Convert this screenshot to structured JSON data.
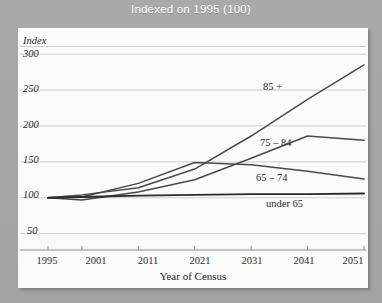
{
  "figure": {
    "title": "Indexed on 1995 (100)",
    "title_color": "#ffffff",
    "background_color": "#a8a8a8",
    "panel_color": "#fbfbfb"
  },
  "axes": {
    "y_title": "Index",
    "x_title": "Year of Census",
    "y_ticks": [
      "300",
      "250",
      "200",
      "150",
      "100",
      "50"
    ],
    "x_ticks": [
      "1995",
      "2001",
      "2011",
      "2021",
      "2031",
      "2041",
      "2051"
    ]
  },
  "series_labels": {
    "s85plus": "85 +",
    "s75_84": "75 – 84",
    "s65_74": "65 – 74",
    "under65": "under 65"
  },
  "chart_data": {
    "type": "line",
    "title": "Indexed on 1995 (100)",
    "xlabel": "Year of Census",
    "ylabel": "Index",
    "x": [
      1995,
      2001,
      2011,
      2021,
      2031,
      2041,
      2051
    ],
    "xlim": [
      1995,
      2051
    ],
    "ylim": [
      30,
      310
    ],
    "grid": true,
    "gridlines": [
      50,
      100,
      150,
      200,
      250,
      300
    ],
    "legend_position": "inline-labels",
    "series": [
      {
        "name": "85 +",
        "color": "#4a4a4a",
        "values": [
          100,
          104,
          114,
          140,
          186,
          237,
          285
        ],
        "label_text": "85 +"
      },
      {
        "name": "75 – 84",
        "color": "#4a4a4a",
        "values": [
          100,
          97,
          108,
          125,
          155,
          186,
          180
        ],
        "label_text": "75 – 84"
      },
      {
        "name": "65 – 74",
        "color": "#4a4a4a",
        "values": [
          100,
          101,
          120,
          149,
          146,
          137,
          126
        ],
        "label_text": "65 – 74"
      },
      {
        "name": "under 65",
        "color": "#2b2b2b",
        "values": [
          100,
          101,
          103,
          104,
          105,
          105,
          106
        ],
        "label_text": "under 65"
      }
    ]
  }
}
